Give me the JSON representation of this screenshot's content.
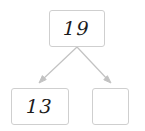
{
  "diagram": {
    "type": "number-bond-tree",
    "background_color": "#ffffff",
    "border_color": "#cfcfcf",
    "arrow_color": "#c2c2c2",
    "text_color": "#1b1b1b",
    "nodes": [
      {
        "id": "root",
        "label": "19",
        "role": "total"
      },
      {
        "id": "left",
        "label": "13",
        "role": "part"
      },
      {
        "id": "right",
        "label": "",
        "role": "part-blank"
      }
    ],
    "edges": [
      {
        "from": "root",
        "to": "left",
        "style": "arrow"
      },
      {
        "from": "root",
        "to": "right",
        "style": "arrow"
      }
    ]
  }
}
